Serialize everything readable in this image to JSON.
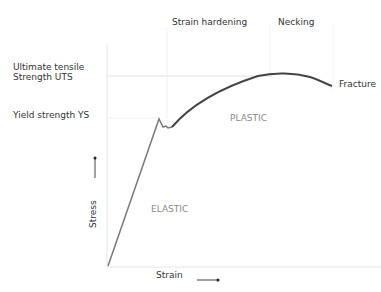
{
  "diagram": {
    "phase_labels": {
      "strain_hardening": "Strain hardening",
      "necking": "Necking"
    },
    "left_labels": {
      "uts_line1": "Ultimate tensile",
      "uts_line2": "Strength UTS",
      "ys": "Yield strength YS"
    },
    "curve_labels": {
      "fracture": "Fracture"
    },
    "regions": {
      "elastic": "ELASTIC",
      "plastic": "PLASTIC"
    },
    "axes": {
      "x_label": "Strain",
      "y_label": "Stress"
    },
    "colors": {
      "curve_elastic": "#7a7a7a",
      "curve_plastic": "#444444",
      "guide_lines": "#e2e2e2",
      "text": "#333333",
      "region_text": "#8a8a8a"
    }
  }
}
